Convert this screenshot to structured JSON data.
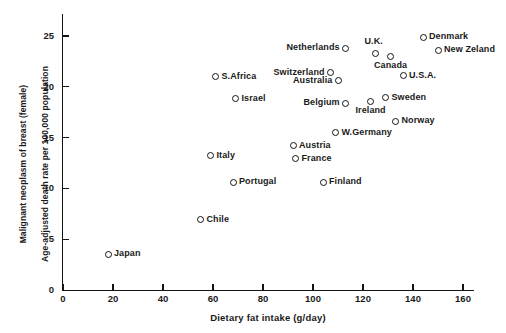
{
  "chart_data": {
    "type": "scatter",
    "title": "",
    "xlabel": "Dietary fat intake (g/day)",
    "ylabel": "Malignant neoplasm of breast (female)\nAge-adjusted death rate per 100,000 population",
    "ylabel_line1": "Malignant neoplasm of breast (female)",
    "ylabel_line2": "Age-adjusted death rate per 100,000 population",
    "xlim": [
      0,
      168
    ],
    "ylim": [
      0,
      27.5
    ],
    "xticks": [
      0,
      20,
      40,
      60,
      80,
      100,
      120,
      140,
      160
    ],
    "yticks": [
      0,
      5,
      10,
      15,
      20,
      25
    ],
    "xticklabels": [
      "0",
      "20",
      "40",
      "60",
      "80",
      "100",
      "120",
      "140",
      "160"
    ],
    "yticklabels": [
      "0",
      "5",
      "10",
      "15",
      "20",
      "25"
    ],
    "grid": false,
    "legend": false,
    "marker": "open-circle",
    "points": [
      {
        "label": "Japan",
        "x": 18,
        "y": 3.5,
        "label_pos": "right"
      },
      {
        "label": "Chile",
        "x": 55,
        "y": 6.9,
        "label_pos": "right"
      },
      {
        "label": "Portugal",
        "x": 68,
        "y": 10.6,
        "label_pos": "right"
      },
      {
        "label": "Italy",
        "x": 59,
        "y": 13.2,
        "label_pos": "right"
      },
      {
        "label": "Israel",
        "x": 69,
        "y": 18.8,
        "label_pos": "right"
      },
      {
        "label": "S.Africa",
        "x": 61,
        "y": 21.0,
        "label_pos": "right"
      },
      {
        "label": "Austria",
        "x": 92,
        "y": 14.2,
        "label_pos": "right"
      },
      {
        "label": "France",
        "x": 93,
        "y": 12.9,
        "label_pos": "right"
      },
      {
        "label": "Finland",
        "x": 104,
        "y": 10.6,
        "label_pos": "right"
      },
      {
        "label": "W.Germany",
        "x": 109,
        "y": 15.5,
        "label_pos": "right"
      },
      {
        "label": "Belgium",
        "x": 113,
        "y": 18.4,
        "label_pos": "left"
      },
      {
        "label": "Australia",
        "x": 110,
        "y": 20.6,
        "label_pos": "left"
      },
      {
        "label": "Switzerland",
        "x": 107,
        "y": 21.4,
        "label_pos": "left"
      },
      {
        "label": "Netherlands",
        "x": 113,
        "y": 23.8,
        "label_pos": "left"
      },
      {
        "label": "U.K.",
        "x": 125,
        "y": 23.3,
        "label_pos": "above-left"
      },
      {
        "label": "Canada",
        "x": 131,
        "y": 23.0,
        "label_pos": "below"
      },
      {
        "label": "Ireland",
        "x": 123,
        "y": 18.6,
        "label_pos": "below"
      },
      {
        "label": "Sweden",
        "x": 129,
        "y": 18.9,
        "label_pos": "right"
      },
      {
        "label": "Norway",
        "x": 133,
        "y": 16.6,
        "label_pos": "right"
      },
      {
        "label": "U.S.A.",
        "x": 136,
        "y": 21.1,
        "label_pos": "right"
      },
      {
        "label": "Denmark",
        "x": 144,
        "y": 24.9,
        "label_pos": "right"
      },
      {
        "label": "New Zeland",
        "x": 150,
        "y": 23.6,
        "label_pos": "right"
      }
    ]
  }
}
